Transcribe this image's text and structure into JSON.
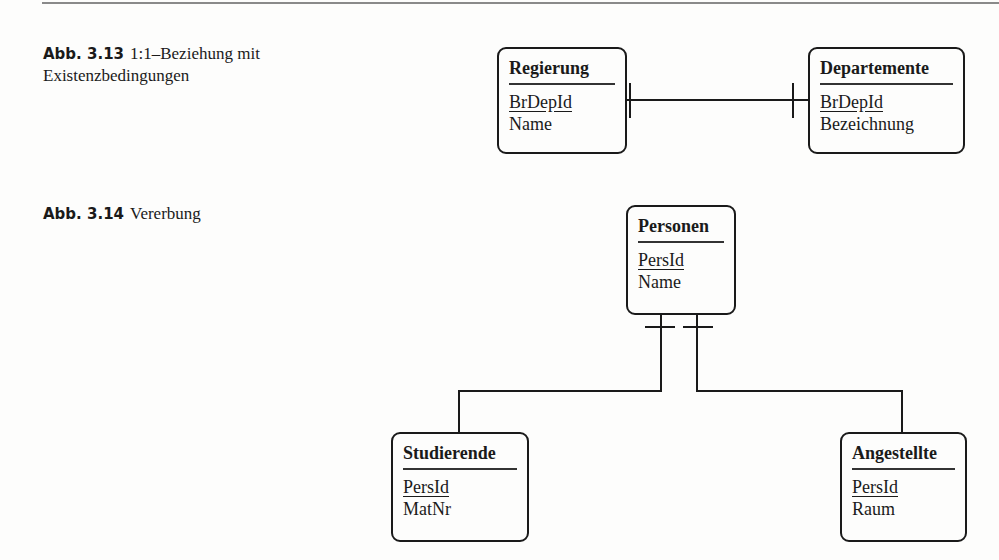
{
  "figures": [
    {
      "label": "Abb. 3.13",
      "caption_line1": "1:1–Beziehung mit",
      "caption_line2": "Existenzbedingungen",
      "entities": [
        {
          "name": "Regierung",
          "attributes": [
            {
              "text": "BrDepId",
              "primary_key": true
            },
            {
              "text": "Name",
              "primary_key": false
            }
          ]
        },
        {
          "name": "Departemente",
          "attributes": [
            {
              "text": "BrDepId",
              "primary_key": true
            },
            {
              "text": "Bezeichnung",
              "primary_key": false
            }
          ]
        }
      ],
      "relationship": {
        "type": "1:1",
        "from": "Regierung",
        "to": "Departemente",
        "notation": "mandatory-one both ends"
      }
    },
    {
      "label": "Abb. 3.14",
      "caption": "Vererbung",
      "entities": [
        {
          "name": "Personen",
          "attributes": [
            {
              "text": "PersId",
              "primary_key": true
            },
            {
              "text": "Name",
              "primary_key": false
            }
          ]
        },
        {
          "name": "Studierende",
          "attributes": [
            {
              "text": "PersId",
              "primary_key": true
            },
            {
              "text": "MatNr",
              "primary_key": false
            }
          ]
        },
        {
          "name": "Angestellte",
          "attributes": [
            {
              "text": "PersId",
              "primary_key": true
            },
            {
              "text": "Raum",
              "primary_key": false
            }
          ]
        }
      ],
      "relationship": {
        "type": "inheritance",
        "parent": "Personen",
        "children": [
          "Studierende",
          "Angestellte"
        ]
      }
    }
  ]
}
